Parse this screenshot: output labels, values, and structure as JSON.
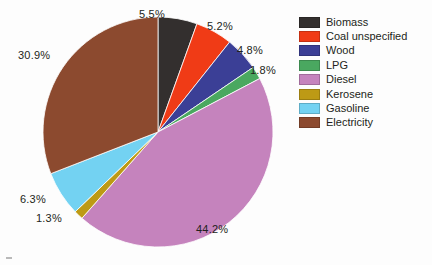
{
  "chart_data": {
    "type": "pie",
    "title": "",
    "subtitle": "",
    "xlabel": "",
    "ylabel": "",
    "legend_position": "right",
    "grid": false,
    "start_angle_deg": 0,
    "direction": "clockwise",
    "categories": [
      "Biomass",
      "Coal unspecified",
      "Wood",
      "LPG",
      "Diesel",
      "Kerosene",
      "Gasoline",
      "Electricity"
    ],
    "values": [
      5.5,
      5.2,
      4.8,
      1.8,
      44.2,
      1.3,
      6.3,
      30.9
    ],
    "value_labels": [
      "5.5%",
      "5.2%",
      "4.8%",
      "1.8%",
      "44.2%",
      "1.3%",
      "6.3%",
      "30.9%"
    ],
    "colors": [
      "#332f2e",
      "#f03b16",
      "#3b3f96",
      "#4aa860",
      "#c583bd",
      "#bd9a15",
      "#73d2f2",
      "#8c4a2f"
    ],
    "units": "percent",
    "total": 100.0,
    "slices": [
      {
        "label": "Biomass",
        "value": 5.5,
        "value_label": "5.5%",
        "color": "#332f2e"
      },
      {
        "label": "Coal unspecified",
        "value": 5.2,
        "value_label": "5.2%",
        "color": "#f03b16"
      },
      {
        "label": "Wood",
        "value": 4.8,
        "value_label": "4.8%",
        "color": "#3b3f96"
      },
      {
        "label": "LPG",
        "value": 1.8,
        "value_label": "1.8%",
        "color": "#4aa860"
      },
      {
        "label": "Diesel",
        "value": 44.2,
        "value_label": "44.2%",
        "color": "#c583bd"
      },
      {
        "label": "Kerosene",
        "value": 1.3,
        "value_label": "1.3%",
        "color": "#bd9a15"
      },
      {
        "label": "Gasoline",
        "value": 6.3,
        "value_label": "6.3%",
        "color": "#73d2f2"
      },
      {
        "label": "Electricity",
        "value": 30.9,
        "value_label": "30.9%",
        "color": "#8c4a2f"
      }
    ]
  },
  "legend": {
    "items": [
      {
        "label": "Biomass",
        "color": "#332f2e"
      },
      {
        "label": "Coal unspecified",
        "color": "#f03b16"
      },
      {
        "label": "Wood",
        "color": "#3b3f96"
      },
      {
        "label": "LPG",
        "color": "#4aa860"
      },
      {
        "label": "Diesel",
        "color": "#c583bd"
      },
      {
        "label": "Kerosene",
        "color": "#bd9a15"
      },
      {
        "label": "Gasoline",
        "color": "#73d2f2"
      },
      {
        "label": "Electricity",
        "color": "#8c4a2f"
      }
    ]
  },
  "labels": {
    "biomass_pct": "5.5%",
    "coal_pct": "5.2%",
    "wood_pct": "4.8%",
    "lpg_pct": "1.8%",
    "diesel_pct": "44.2%",
    "kerosene_pct": "1.3%",
    "gasoline_pct": "6.3%",
    "electricity_pct": "30.9%"
  }
}
